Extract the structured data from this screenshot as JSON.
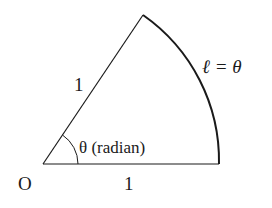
{
  "diagram": {
    "origin_label": "O",
    "radius_label_upper": "1",
    "radius_label_bottom": "1",
    "angle_label": "θ (radian)",
    "arc_label": "ℓ = θ",
    "colors": {
      "stroke": "#1a1a1a",
      "background": "#ffffff"
    }
  }
}
